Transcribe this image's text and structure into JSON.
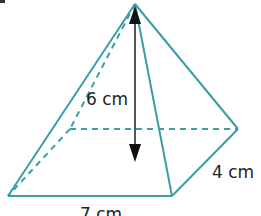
{
  "diagram": {
    "type": "square-based pyramid (rectangular base)",
    "colors": {
      "edge": "#3a9ea5",
      "arrow": "#111111",
      "text": "#222222"
    },
    "labels": {
      "height": "6 cm",
      "depth": "4 cm",
      "width": "7 cm"
    },
    "vertices": {
      "apex": [
        135,
        4
      ],
      "front_left": [
        8,
        196
      ],
      "front_right": [
        172,
        196
      ],
      "back_right": [
        238,
        129
      ],
      "back_left": [
        70,
        129
      ]
    }
  }
}
